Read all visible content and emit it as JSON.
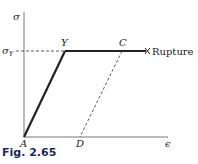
{
  "figure": {
    "caption": "Fig. 2.65",
    "axes": {
      "y_label": "σ",
      "x_label": "ϵ"
    },
    "labels": {
      "sigma_y": "σY",
      "sigma_y_main": "σ",
      "sigma_y_sub": "Y",
      "point_y": "Y",
      "point_c": "C",
      "point_a": "A",
      "point_d": "D",
      "rupture": "Rupture"
    },
    "colors": {
      "line": "#222222",
      "caption": "#1a2a5a"
    }
  }
}
